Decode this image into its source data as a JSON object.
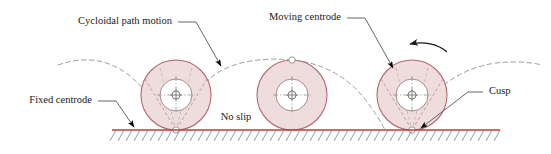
{
  "figure": {
    "kind": "cycloidal-rolling-circle-diagram",
    "width": 551,
    "height": 154
  },
  "labels": {
    "cycloidal_path_motion": "Cycloidal path motion",
    "moving_centrode": "Moving centrode",
    "fixed_centrode": "Fixed centrode",
    "no_slip": "No slip",
    "cusp": "Cusp"
  },
  "colors": {
    "circle_fill": "#efdcdc",
    "circle_stroke": "#b5696e",
    "inner_circle_stroke": "#9a7f85",
    "ground_line": "#c0393f",
    "hatching": "#8a8a8a",
    "cycloid_dash": "#9d9d9d",
    "leader_line": "#555555",
    "arrow_head": "#000000",
    "text": "#1a1a1a",
    "background": "#ffffff"
  },
  "geometry": {
    "ground_y": 130,
    "ground_x_start": 112,
    "ground_x_end": 500,
    "circle_radius": 35,
    "inner_circle_radius": 16,
    "circles": [
      {
        "name": "left-circle",
        "cx": 176,
        "cy": 95
      },
      {
        "name": "middle-circle",
        "cx": 292,
        "cy": 95
      },
      {
        "name": "right-circle",
        "cx": 412,
        "cy": 95
      }
    ],
    "cusp_points": [
      {
        "name": "cusp-left",
        "x": 176,
        "y": 130
      },
      {
        "name": "cusp-right",
        "x": 412,
        "y": 130
      }
    ],
    "apex_point": {
      "name": "apex-middle",
      "x": 292,
      "y": 60
    }
  }
}
